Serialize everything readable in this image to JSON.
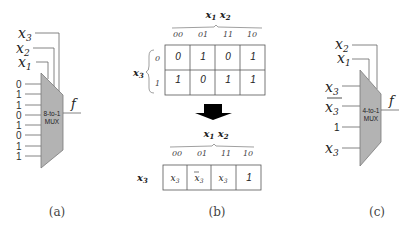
{
  "panel_a": {
    "caption": "(a)",
    "mux_label_line1": "8-to-1",
    "mux_label_line2": "MUX",
    "select_labels": [
      {
        "var": "x",
        "sub": "3"
      },
      {
        "var": "x",
        "sub": "2"
      },
      {
        "var": "x",
        "sub": "1"
      }
    ],
    "inputs": [
      "0",
      "1",
      "1",
      "0",
      "1",
      "0",
      "1",
      "1"
    ],
    "output_label": "f"
  },
  "panel_b": {
    "caption": "(b)",
    "kmap_top": {
      "column_header": {
        "v1": "x",
        "s1": "1",
        "v2": "x",
        "s2": "2"
      },
      "row_header": {
        "var": "x",
        "sub": "3"
      },
      "column_labels": [
        "00",
        "01",
        "11",
        "10"
      ],
      "row_labels": [
        "0",
        "1"
      ],
      "cells": [
        [
          "0",
          "1",
          "0",
          "1"
        ],
        [
          "1",
          "0",
          "1",
          "1"
        ]
      ]
    },
    "arrow": "down-arrow",
    "kmap_bottom": {
      "column_header": {
        "v1": "x",
        "s1": "1",
        "v2": "x",
        "s2": "2"
      },
      "row_header": {
        "var": "x",
        "sub": "3"
      },
      "column_labels": [
        "00",
        "01",
        "11",
        "10"
      ],
      "cells": [
        {
          "text": "x",
          "sub": "3",
          "bar": false
        },
        {
          "text": "x",
          "sub": "3",
          "bar": true
        },
        {
          "text": "x",
          "sub": "3",
          "bar": false
        },
        {
          "text": "1",
          "sub": "",
          "bar": false
        }
      ]
    }
  },
  "panel_c": {
    "caption": "(c)",
    "mux_label_line1": "4-to-1",
    "mux_label_line2": "MUX",
    "select_labels": [
      {
        "var": "x",
        "sub": "2"
      },
      {
        "var": "x",
        "sub": "1"
      }
    ],
    "inputs": [
      {
        "text": "x",
        "sub": "3",
        "bar": false
      },
      {
        "text": "x",
        "sub": "3",
        "bar": true
      },
      {
        "text": "1",
        "sub": "",
        "bar": false
      },
      {
        "text": "x",
        "sub": "3",
        "bar": false
      }
    ],
    "output_label": "f"
  },
  "colors": {
    "mux_fill": "#b3b3b3",
    "mux_stroke": "#7a7a7a",
    "line": "#555555",
    "text": "#222222",
    "arrow": "#000000"
  }
}
